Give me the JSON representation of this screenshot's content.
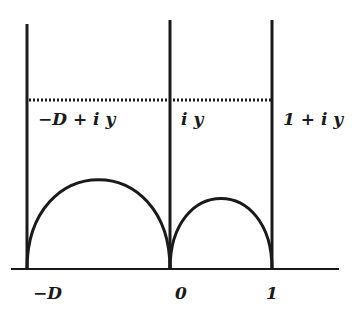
{
  "diagram": {
    "colors": {
      "stroke": "#1a1a1a",
      "background": "#ffffff"
    },
    "axis_labels": {
      "neg_d": "−D",
      "zero": "0",
      "one": "1"
    },
    "line_labels": {
      "neg_d_plus_iy": "−D + i y",
      "iy": "i y",
      "one_plus_iy": "1 + i y"
    },
    "elements": {
      "vertical_lines": [
        "x = −D",
        "x = 0",
        "x = 1"
      ],
      "horizontal_dotted_line": "Im = y",
      "semicircles": [
        "from −D to 0",
        "from 0 to 1"
      ],
      "real_axis": "real axis"
    }
  }
}
